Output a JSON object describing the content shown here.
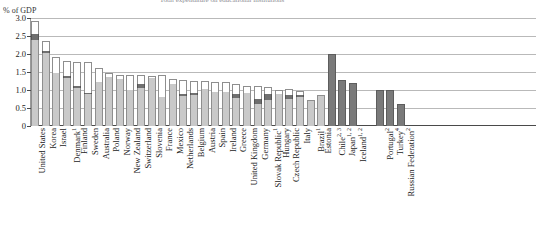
{
  "chart_data": {
    "type": "bar",
    "title": "Total expenditure on educational institutions",
    "ylabel": "% of GDP",
    "xlabel": "",
    "ylim": [
      0,
      3.0
    ],
    "yticks": [
      "0",
      "0.5",
      "1.0",
      "1.5",
      "2.0",
      "2.5",
      "3.0"
    ],
    "ytick_values": [
      0,
      0.5,
      1.0,
      1.5,
      2.0,
      2.5,
      3.0
    ],
    "grid": true,
    "legend_position": "none",
    "stacked": true,
    "series": [
      {
        "name": "primary-segment",
        "color": "#c9c9c9"
      },
      {
        "name": "middle-segment",
        "color": "#6f6f6f"
      },
      {
        "name": "top-segment",
        "color": "#ffffff"
      }
    ],
    "group_gap_after_index": 30,
    "categories": [
      "United States",
      "Korea",
      "Israel",
      "Denmark",
      "Finland",
      "Sweden",
      "Australia",
      "Poland",
      "Norway",
      "New Zealand",
      "Switzerland",
      "Slovenia",
      "France",
      "Mexico",
      "Netherlands",
      "Belgium",
      "Austria",
      "Spain",
      "Ireland",
      "Greece",
      "United Kingdom",
      "Germany",
      "Slovak Republic",
      "Hungary",
      "Czech Republic",
      "Italy",
      "Brazil",
      "Estonia",
      "Chile",
      "Japan",
      "Iceland",
      "Portugal",
      "Turkey",
      "Russian Federation"
    ],
    "category_footnotes": [
      "",
      "",
      "",
      "1",
      "",
      "",
      "",
      "",
      "",
      "",
      "",
      "",
      "",
      "",
      "",
      "",
      "",
      "",
      "",
      "",
      "",
      "",
      "1",
      "",
      "",
      "",
      "1",
      "",
      "2, 3",
      "1, 2",
      "1, 2",
      "2",
      "4",
      "2"
    ],
    "bars": [
      {
        "label": "United States",
        "footnote": "",
        "total": 2.92,
        "primary": 2.4,
        "middle": 0.15,
        "top": 0.37,
        "solid": false
      },
      {
        "label": "Korea",
        "footnote": "",
        "total": 2.35,
        "primary": 2.03,
        "middle": 0.05,
        "top": 0.27,
        "solid": false
      },
      {
        "label": "Israel",
        "footnote": "",
        "total": 1.93,
        "primary": 1.48,
        "middle": 0.0,
        "top": 0.45,
        "solid": false
      },
      {
        "label": "Denmark",
        "footnote": "1",
        "total": 1.82,
        "primary": 1.32,
        "middle": 0.08,
        "top": 0.42,
        "solid": false
      },
      {
        "label": "Finland",
        "footnote": "",
        "total": 1.78,
        "primary": 1.06,
        "middle": 0.04,
        "top": 0.68,
        "solid": false
      },
      {
        "label": "Sweden",
        "footnote": "",
        "total": 1.77,
        "primary": 0.88,
        "middle": 0.04,
        "top": 0.85,
        "solid": false
      },
      {
        "label": "Australia",
        "footnote": "",
        "total": 1.62,
        "primary": 1.22,
        "middle": 0.0,
        "top": 0.4,
        "solid": false
      },
      {
        "label": "Poland",
        "footnote": "",
        "total": 1.46,
        "primary": 1.36,
        "middle": 0.0,
        "top": 0.1,
        "solid": false
      },
      {
        "label": "Norway",
        "footnote": "",
        "total": 1.43,
        "primary": 1.3,
        "middle": 0.0,
        "top": 0.13,
        "solid": false
      },
      {
        "label": "New Zealand",
        "footnote": "",
        "total": 1.42,
        "primary": 1.0,
        "middle": 0.0,
        "top": 0.42,
        "solid": false
      },
      {
        "label": "Switzerland",
        "footnote": "",
        "total": 1.42,
        "primary": 1.06,
        "middle": 0.1,
        "top": 0.26,
        "solid": false
      },
      {
        "label": "Slovenia",
        "footnote": "",
        "total": 1.4,
        "primary": 1.33,
        "middle": 0.0,
        "top": 0.07,
        "solid": false
      },
      {
        "label": "France",
        "footnote": "",
        "total": 1.42,
        "primary": 0.8,
        "middle": 0.0,
        "top": 0.62,
        "solid": false
      },
      {
        "label": "Mexico",
        "footnote": "",
        "total": 1.3,
        "primary": 1.18,
        "middle": 0.0,
        "top": 0.12,
        "solid": false
      },
      {
        "label": "Netherlands",
        "footnote": "",
        "total": 1.28,
        "primary": 0.83,
        "middle": 0.06,
        "top": 0.39,
        "solid": false
      },
      {
        "label": "Belgium",
        "footnote": "",
        "total": 1.26,
        "primary": 0.86,
        "middle": 0.05,
        "top": 0.35,
        "solid": false
      },
      {
        "label": "Austria",
        "footnote": "",
        "total": 1.24,
        "primary": 1.04,
        "middle": 0.0,
        "top": 0.2,
        "solid": false
      },
      {
        "label": "Spain",
        "footnote": "",
        "total": 1.22,
        "primary": 0.95,
        "middle": 0.0,
        "top": 0.27,
        "solid": false
      },
      {
        "label": "Ireland",
        "footnote": "",
        "total": 1.21,
        "primary": 0.94,
        "middle": 0.0,
        "top": 0.27,
        "solid": false
      },
      {
        "label": "Greece",
        "footnote": "",
        "total": 1.18,
        "primary": 0.78,
        "middle": 0.12,
        "top": 0.28,
        "solid": false
      },
      {
        "label": "United Kingdom",
        "footnote": "",
        "total": 1.12,
        "primary": 0.92,
        "middle": 0.0,
        "top": 0.2,
        "solid": false
      },
      {
        "label": "Germany",
        "footnote": "",
        "total": 1.12,
        "primary": 0.6,
        "middle": 0.14,
        "top": 0.38,
        "solid": false
      },
      {
        "label": "Slovak Republic",
        "footnote": "1",
        "total": 1.09,
        "primary": 0.72,
        "middle": 0.18,
        "top": 0.19,
        "solid": false
      },
      {
        "label": "Hungary",
        "footnote": "",
        "total": 1.0,
        "primary": 0.88,
        "middle": 0.0,
        "top": 0.12,
        "solid": false
      },
      {
        "label": "Czech Republic",
        "footnote": "",
        "total": 1.04,
        "primary": 0.76,
        "middle": 0.1,
        "top": 0.18,
        "solid": false
      },
      {
        "label": "Italy",
        "footnote": "",
        "total": 0.98,
        "primary": 0.8,
        "middle": 0.06,
        "top": 0.12,
        "solid": false
      },
      {
        "label": "Brazil",
        "footnote": "1",
        "total": 0.73,
        "primary": 0.73,
        "middle": 0.0,
        "top": 0.0,
        "solid": false
      },
      {
        "label": "Estonia",
        "footnote": "",
        "total": 0.86,
        "primary": 0.86,
        "middle": 0.0,
        "top": 0.0,
        "solid": false
      },
      {
        "label": "Chile",
        "footnote": "2, 3",
        "total": 2.01,
        "primary": 2.01,
        "middle": 0.0,
        "top": 0.0,
        "solid": true
      },
      {
        "label": "Japan",
        "footnote": "1, 2",
        "total": 1.28,
        "primary": 1.28,
        "middle": 0.0,
        "top": 0.0,
        "solid": true
      },
      {
        "label": "Iceland",
        "footnote": "1, 2",
        "total": 1.2,
        "primary": 1.2,
        "middle": 0.0,
        "top": 0.0,
        "solid": true
      },
      {
        "label": "Portugal",
        "footnote": "2",
        "total": 1.0,
        "primary": 1.0,
        "middle": 0.0,
        "top": 0.0,
        "solid": true
      },
      {
        "label": "Turkey",
        "footnote": "4",
        "total": 1.0,
        "primary": 1.0,
        "middle": 0.0,
        "top": 0.0,
        "solid": true
      },
      {
        "label": "Russian Federation",
        "footnote": "2",
        "total": 0.61,
        "primary": 0.61,
        "middle": 0.0,
        "top": 0.0,
        "solid": true
      }
    ]
  }
}
